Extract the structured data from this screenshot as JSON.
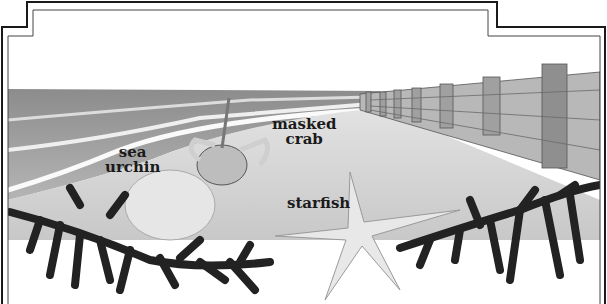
{
  "illustration": {
    "scene": "beach with groyne fence, waves, seaweed",
    "labels": {
      "sea_urchin_line1": "sea",
      "sea_urchin_line2": "urchin",
      "masked_crab_line1": "masked",
      "masked_crab_line2": "crab",
      "starfish": "starfish"
    },
    "colors": {
      "frame": "#1a1a1a",
      "sky": "#ffffff",
      "sea": "#9a9a9a",
      "sand": "#d8d8d8",
      "seaweed": "#222222",
      "fence": "#8a8a8a",
      "text": "#1a1a1a"
    }
  }
}
